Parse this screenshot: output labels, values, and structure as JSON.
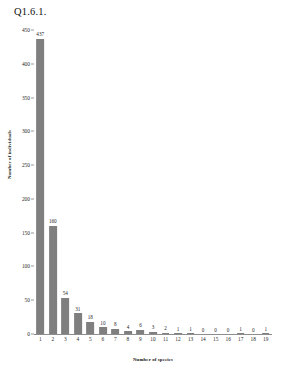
{
  "chart_data": {
    "type": "bar",
    "title": "Q1.6.1.",
    "xlabel": "Number of species",
    "ylabel": "Number of individuals",
    "categories": [
      "1",
      "2",
      "3",
      "4",
      "5",
      "6",
      "7",
      "8",
      "9",
      "10",
      "11",
      "12",
      "13",
      "14",
      "15",
      "16",
      "17",
      "18",
      "19"
    ],
    "values": [
      437,
      160,
      54,
      31,
      18,
      10,
      8,
      4,
      6,
      3,
      2,
      1,
      1,
      0,
      0,
      0,
      1,
      0,
      1
    ],
    "data_labels": [
      "437",
      "160",
      "54",
      "31",
      "18",
      "10",
      "8",
      "4",
      "6",
      "3",
      "2",
      "1",
      "1",
      "0",
      "0",
      "0",
      "1",
      "0",
      "1"
    ],
    "ylim": [
      0,
      450
    ],
    "ytick_values": [
      0,
      50,
      100,
      150,
      200,
      250,
      300,
      350,
      400,
      450
    ],
    "ytick_labels": [
      "0",
      "50",
      "100",
      "150",
      "200",
      "250",
      "300",
      "350",
      "400",
      "450"
    ],
    "grid": false,
    "legend": false,
    "legend_position": "none",
    "bar_color": "#7f7f7f",
    "axis_color": "#8d8d8d",
    "background_color": "#ffffff",
    "text_color": "#1a1a1a"
  }
}
